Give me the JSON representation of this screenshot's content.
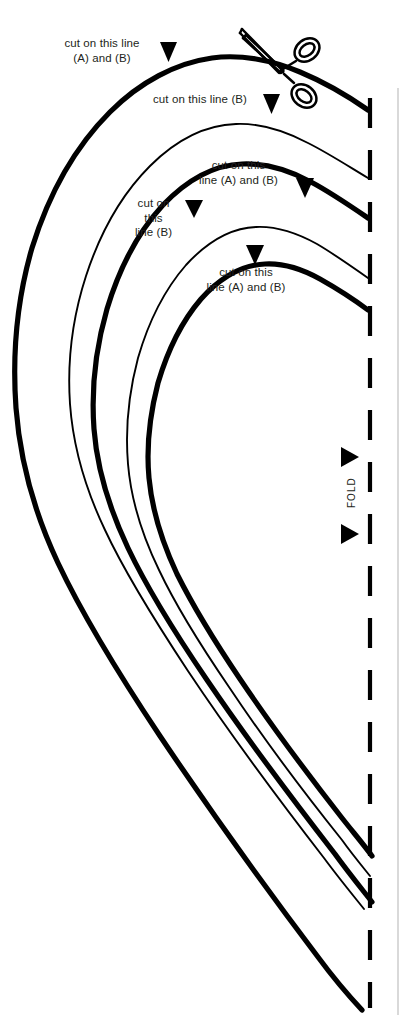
{
  "figure": {
    "background_color": "#ffffff",
    "ink_color": "#000000",
    "text_color": "#231f20",
    "width": 405,
    "height": 1015
  },
  "labels": {
    "outer_cut": "cut on this line\n(A) and (B)",
    "second_cut": "cut on this line (B)",
    "third_cut": "cut on this\nline (A) and (B)",
    "fourth_cut": "cut on\nthis\nline (B)",
    "fifth_cut": "cut on this\nline (A) and (B)",
    "fold": "FOLD"
  },
  "markers": {
    "outer_cut_arrow": "triangle-down-icon",
    "second_cut_arrow": "triangle-down-icon",
    "third_cut_arrow": "triangle-up-icon",
    "fourth_cut_arrow": "triangle-up-icon",
    "fifth_cut_arrow": "triangle-up-icon",
    "fold_arrow_top": "triangle-right-icon",
    "fold_arrow_bottom": "triangle-right-icon",
    "tool": "scissors-icon"
  },
  "lines": [
    {
      "name": "cut-line-1-outer",
      "weight": "thick",
      "label_ref": "outer_cut"
    },
    {
      "name": "cut-line-2",
      "weight": "thin",
      "label_ref": "second_cut"
    },
    {
      "name": "cut-line-3",
      "weight": "thick",
      "label_ref": "third_cut"
    },
    {
      "name": "cut-line-4",
      "weight": "thin",
      "label_ref": "fourth_cut"
    },
    {
      "name": "cut-line-5-inner",
      "weight": "thick",
      "label_ref": "fifth_cut"
    },
    {
      "name": "fold-line",
      "weight": "dashed",
      "label_ref": "fold"
    }
  ]
}
